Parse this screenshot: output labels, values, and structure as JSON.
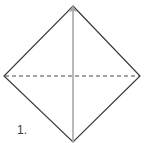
{
  "figure": {
    "step_label": "1.",
    "caption": "",
    "canvas": {
      "width": 146,
      "height": 143,
      "background": "#ffffff"
    },
    "colors": {
      "outline": "#3a3a3a",
      "fold_dashed": "#4a4a4a",
      "fold_vertical": "#a8a8a8",
      "label_text": "#3b3b3b",
      "background": "#ffffff"
    },
    "shape": {
      "name": "square-rotated-45",
      "vertices": {
        "top": {
          "x": 73,
          "y": 6
        },
        "right": {
          "x": 140,
          "y": 76
        },
        "bottom": {
          "x": 73,
          "y": 142
        },
        "left": {
          "x": 4,
          "y": 76
        }
      },
      "outline_points": "73,6 140,76 73,142 4,76",
      "outline_stroke_width": 1.2
    },
    "fold_lines": [
      {
        "name": "horizontal-diagonal-dashed",
        "style": "dashed",
        "dash_pattern": "4 3",
        "stroke_width": 1.2,
        "from": {
          "x": 5,
          "y": 76
        },
        "to": {
          "x": 139,
          "y": 76
        }
      },
      {
        "name": "vertical-diagonal-arrow",
        "style": "solid",
        "stroke_width": 1.6,
        "from": {
          "x": 73,
          "y": 142
        },
        "to": {
          "x": 73,
          "y": 9
        },
        "arrowhead": "top",
        "arrowhead_points": "73,5 69.4,12.5 73,10.6 76.6,12.5"
      }
    ]
  }
}
